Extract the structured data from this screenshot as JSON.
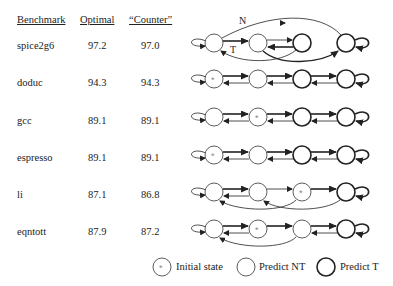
{
  "table": {
    "headers": [
      "Benchmark",
      "Optimal",
      "“Counter”"
    ],
    "rows": [
      {
        "benchmark": "spice2g6",
        "optimal": "97.2",
        "counter": "97.0"
      },
      {
        "benchmark": "doduc",
        "optimal": "94.3",
        "counter": "94.3"
      },
      {
        "benchmark": "gcc",
        "optimal": "89.1",
        "counter": "89.1"
      },
      {
        "benchmark": "espresso",
        "optimal": "89.1",
        "counter": "89.1"
      },
      {
        "benchmark": "li",
        "optimal": "87.1",
        "counter": "86.8"
      },
      {
        "benchmark": "eqntott",
        "optimal": "87.9",
        "counter": "87.2"
      }
    ]
  },
  "diagram": {
    "edge_labels": {
      "n": "N",
      "t": "T"
    },
    "initial_marker": "*",
    "states_per_machine": 4,
    "machines": [
      {
        "benchmark": "spice2g6",
        "predict_t": [
          false,
          false,
          true,
          true
        ],
        "initial": null
      },
      {
        "benchmark": "doduc",
        "predict_t": [
          false,
          false,
          true,
          true
        ],
        "initial": 0
      },
      {
        "benchmark": "gcc",
        "predict_t": [
          false,
          false,
          true,
          true
        ],
        "initial": 1
      },
      {
        "benchmark": "espresso",
        "predict_t": [
          false,
          false,
          true,
          true
        ],
        "initial": 0
      },
      {
        "benchmark": "li",
        "predict_t": [
          false,
          false,
          false,
          true
        ],
        "initial": 2
      },
      {
        "benchmark": "eqntott",
        "predict_t": [
          false,
          false,
          false,
          true
        ],
        "initial": 1
      }
    ]
  },
  "legend": {
    "initial_state": "Initial state",
    "predict_nt": "Predict NT",
    "predict_t": "Predict T",
    "star": "*"
  }
}
